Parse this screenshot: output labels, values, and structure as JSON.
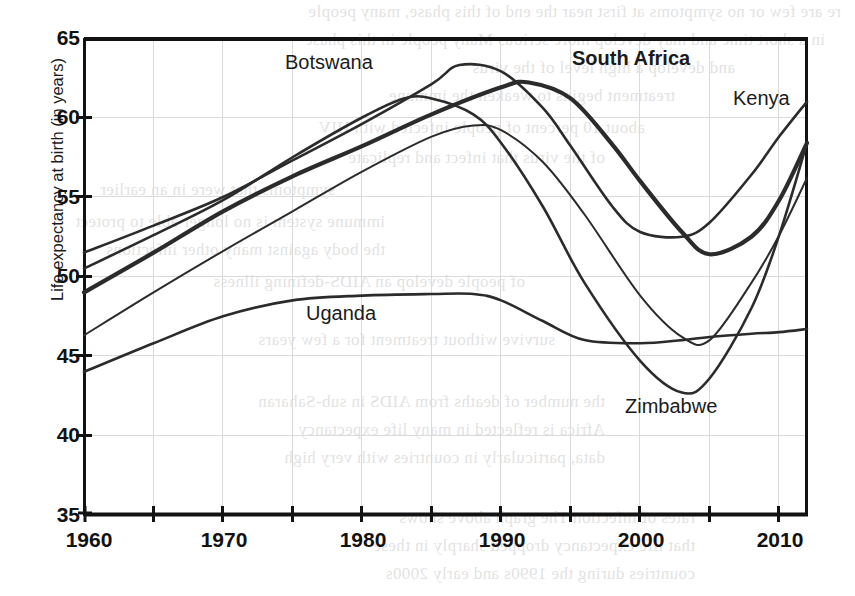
{
  "figure": {
    "kind": "line-chart",
    "plot_area": {
      "x": 84,
      "y": 38,
      "width": 723,
      "height": 477
    },
    "background_color": "#ffffff",
    "axis_color": "#111111",
    "grid_color": "#d8d8d8"
  },
  "axes": {
    "y_title": "Life expectancy at birth (in years)",
    "y_ticks": [
      "65",
      "60",
      "55",
      "50",
      "45",
      "40",
      "35"
    ],
    "x_ticks": [
      "1960",
      "1970",
      "1980",
      "1990",
      "2000",
      "2010"
    ],
    "x_minor_every": 5
  },
  "series_labels": [
    {
      "name": "Botswana",
      "text": "Botswana",
      "x": 285,
      "y": 52,
      "bold": false
    },
    {
      "name": "South Africa",
      "text": "South Africa",
      "x": 572,
      "y": 48,
      "bold": true
    },
    {
      "name": "Kenya",
      "text": "Kenya",
      "x": 733,
      "y": 88,
      "bold": false
    },
    {
      "name": "Uganda",
      "text": "Uganda",
      "x": 306,
      "y": 303,
      "bold": false
    },
    {
      "name": "Zimbabwe",
      "text": "Zimbabwe",
      "x": 625,
      "y": 396,
      "bold": false
    }
  ],
  "bleed_text": [
    {
      "text": "re are few or no symptoms at first  near the end of this phase, many people",
      "x": 14,
      "y": 2
    },
    {
      "text": "in a short time and may develop more serious  Many people in this phase",
      "x": 30,
      "y": 30
    },
    {
      "text": "and develop a high level of the virus",
      "x": 120,
      "y": 58
    },
    {
      "text": "treatment begins to weaken  the immune",
      "x": 180,
      "y": 86
    },
    {
      "text": "about 10 percent of people infected with HIV",
      "x": 210,
      "y": 118
    },
    {
      "text": "of the virus that infect and replicate",
      "x": 250,
      "y": 148
    },
    {
      "text": "symptoms that were  in an earlier",
      "x": 520,
      "y": 180
    },
    {
      "text": "immune system is no longer able to protect",
      "x": 470,
      "y": 212
    },
    {
      "text": "the body against many other infections",
      "x": 470,
      "y": 240
    },
    {
      "text": "of people develop an AIDS-defining illness",
      "x": 330,
      "y": 272
    },
    {
      "text": "survive without treatment for a few years",
      "x": 300,
      "y": 330
    },
    {
      "text": "the number of deaths from AIDS in sub-Saharan",
      "x": 250,
      "y": 392
    },
    {
      "text": "Africa is reflected in many  life expectancy",
      "x": 250,
      "y": 420
    },
    {
      "text": "data, particularly in countries with very high",
      "x": 250,
      "y": 448
    },
    {
      "text": "rates of infection  The graph above shows",
      "x": 160,
      "y": 508
    },
    {
      "text": "that life expectancy dropped sharply in these",
      "x": 160,
      "y": 536
    },
    {
      "text": "countries during the 1990s and early 2000s",
      "x": 160,
      "y": 564
    }
  ],
  "chart_data": {
    "type": "line",
    "title": "",
    "xlabel": "",
    "ylabel": "Life expectancy at birth (in years)",
    "xlim": [
      1960,
      2012
    ],
    "ylim": [
      35,
      65
    ],
    "ytick_values": [
      35,
      40,
      45,
      50,
      55,
      60,
      65
    ],
    "xtick_values": [
      1960,
      1970,
      1980,
      1990,
      2000,
      2010
    ],
    "minor_xtick_values": [
      1965,
      1975,
      1985,
      1995,
      2005
    ],
    "grid": "light horizontal and vertical gridlines",
    "legend": "inline curve annotations (no separate legend box)",
    "series": [
      {
        "name": "Botswana",
        "line_weight": "medium",
        "x": [
          1960,
          1965,
          1970,
          1975,
          1980,
          1985,
          1987,
          1990,
          1993,
          1995,
          1998,
          2000,
          2003,
          2005,
          2008,
          2010,
          2012
        ],
        "values": [
          51.5,
          53.2,
          55.0,
          57.3,
          59.6,
          62.1,
          63.3,
          62.9,
          60.6,
          58.2,
          54.4,
          52.8,
          52.5,
          53.4,
          56.4,
          58.8,
          61.0
        ]
      },
      {
        "name": "South Africa",
        "line_weight": "bold",
        "x": [
          1960,
          1965,
          1970,
          1975,
          1980,
          1985,
          1990,
          1992,
          1995,
          1998,
          2000,
          2003,
          2005,
          2008,
          2010,
          2012
        ],
        "values": [
          49.0,
          51.5,
          54.1,
          56.3,
          58.2,
          60.2,
          61.9,
          62.2,
          61.2,
          58.3,
          56.0,
          52.8,
          51.4,
          52.5,
          54.8,
          58.4
        ]
      },
      {
        "name": "Kenya",
        "line_weight": "thin",
        "x": [
          1960,
          1965,
          1970,
          1975,
          1980,
          1985,
          1988,
          1990,
          1993,
          1996,
          2000,
          2003,
          2005,
          2008,
          2010,
          2012
        ],
        "values": [
          46.3,
          49.0,
          51.6,
          54.1,
          56.6,
          58.8,
          59.5,
          59.2,
          57.2,
          53.9,
          48.8,
          46.2,
          46.0,
          49.6,
          52.6,
          56.2
        ]
      },
      {
        "name": "Zimbabwe",
        "line_weight": "medium",
        "x": [
          1960,
          1965,
          1970,
          1975,
          1980,
          1983,
          1985,
          1988,
          1990,
          1993,
          1996,
          2000,
          2003,
          2005,
          2008,
          2010,
          2012
        ],
        "values": [
          50.5,
          52.6,
          54.8,
          57.5,
          60.0,
          61.2,
          61.2,
          60.2,
          58.4,
          54.4,
          49.6,
          44.7,
          42.7,
          43.6,
          48.0,
          52.6,
          58.4
        ]
      },
      {
        "name": "Uganda",
        "line_weight": "medium",
        "x": [
          1960,
          1965,
          1970,
          1975,
          1980,
          1985,
          1988,
          1990,
          1993,
          1996,
          2000,
          2003,
          2005,
          2008,
          2010,
          2012
        ],
        "values": [
          44.0,
          45.8,
          47.5,
          48.5,
          48.8,
          48.9,
          48.9,
          48.5,
          47.2,
          46.0,
          45.8,
          46.0,
          46.2,
          46.4,
          46.5,
          46.7
        ]
      }
    ]
  }
}
